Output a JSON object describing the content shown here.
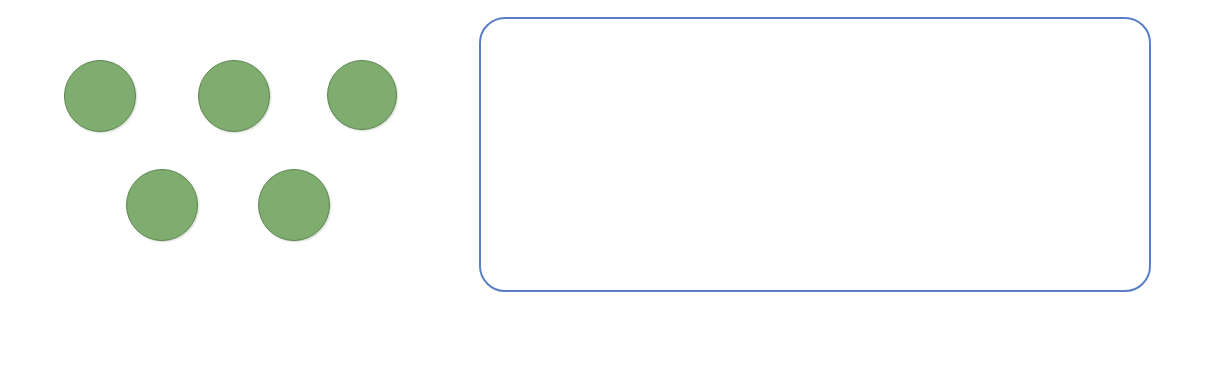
{
  "worksheet": {
    "title": "Addition counting worksheet",
    "background_color": "#ffffff"
  },
  "counters": {
    "label": "green counting circles",
    "total_count": 5,
    "fill_color": "#7fad70",
    "border_color": "#5e8450",
    "diameter": 72,
    "rows": [
      {
        "row_label": "top-row",
        "count": 3,
        "items": [
          {
            "name": "counter-1",
            "x": 64,
            "y": 60
          },
          {
            "name": "counter-2",
            "x": 198,
            "y": 60
          },
          {
            "name": "counter-3",
            "x": 327,
            "y": 60
          }
        ]
      },
      {
        "row_label": "bottom-row",
        "count": 2,
        "items": [
          {
            "name": "counter-4",
            "x": 126,
            "y": 169
          },
          {
            "name": "counter-5",
            "x": 258,
            "y": 169
          }
        ]
      }
    ]
  },
  "work_box": {
    "label": "drawing work area",
    "border_color": "#5b7fc7",
    "fill_color": "#ffffff",
    "content": ""
  },
  "equation": {
    "label": "addition number sentence",
    "addend1": "5",
    "operator_plus": "+",
    "addend2": "",
    "operator_equals": "=",
    "sum": ""
  }
}
